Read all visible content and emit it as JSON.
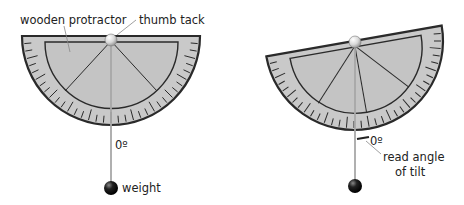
{
  "colors": {
    "protractor_fill": "#c9c9c9",
    "protractor_stroke": "#2a2a2a",
    "string": "#a8a8a8",
    "weight": "#111111",
    "tack": "#e8e8e8",
    "text": "#222222"
  },
  "left_diagram": {
    "label_protractor": "wooden protractor",
    "label_tack": "thumb tack",
    "label_zero": "0º",
    "label_weight": "weight"
  },
  "right_diagram": {
    "label_zero": "0º",
    "label_read_line1": "read angle",
    "label_read_line2": "of tilt",
    "tilt_degrees": -10
  }
}
